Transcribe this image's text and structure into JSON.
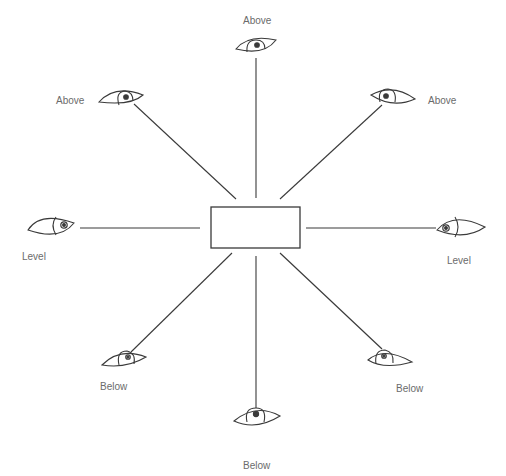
{
  "diagram": {
    "title": "",
    "center_object": {
      "shape": "rectangle",
      "x": 211,
      "y": 207,
      "width": 89,
      "height": 41
    },
    "viewpoints": [
      {
        "id": "top",
        "label": "Above",
        "label_pos": {
          "x": 243,
          "y": 15
        }
      },
      {
        "id": "top-left",
        "label": "Above",
        "label_pos": {
          "x": 56,
          "y": 95
        }
      },
      {
        "id": "top-right",
        "label": "Above",
        "label_pos": {
          "x": 428,
          "y": 95
        }
      },
      {
        "id": "left",
        "label": "Level",
        "label_pos": {
          "x": 22,
          "y": 251
        }
      },
      {
        "id": "right",
        "label": "Level",
        "label_pos": {
          "x": 447,
          "y": 255
        }
      },
      {
        "id": "bottom-left",
        "label": "Below",
        "label_pos": {
          "x": 100,
          "y": 381
        }
      },
      {
        "id": "bottom-right",
        "label": "Below",
        "label_pos": {
          "x": 396,
          "y": 383
        }
      },
      {
        "id": "bottom",
        "label": "Below",
        "label_pos": {
          "x": 243,
          "y": 460
        }
      }
    ],
    "colors": {
      "line": "#3a3a3a",
      "label": "#6b6b6b",
      "background": "#ffffff"
    }
  }
}
